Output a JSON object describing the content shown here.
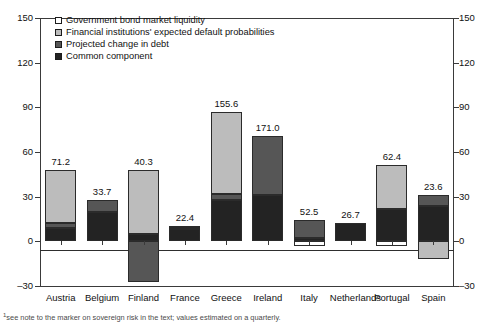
{
  "chart_data": {
    "type": "bar",
    "title": "",
    "subtitle": "",
    "xlabel": "",
    "ylabel": "",
    "stacked": true,
    "grid": false,
    "legend_position": "top-left",
    "ylim": [
      -30,
      150
    ],
    "yticks": [
      -30,
      0,
      30,
      60,
      90,
      120,
      150
    ],
    "ytick_labels_left": [
      "–30",
      "0",
      "30",
      "60",
      "90",
      "120",
      "150"
    ],
    "ytick_labels_right": [
      "–30",
      "0",
      "30",
      "60",
      "90",
      "120",
      "150"
    ],
    "dual_axis": true,
    "categories": [
      "Austria",
      "Belgium",
      "Finland",
      "France",
      "Greece",
      "Ireland",
      "Italy",
      "Netherlands",
      "Portugal",
      "Spain"
    ],
    "data_labels": [
      "71.2",
      "33.7",
      "40.3",
      "22.4",
      "155.6",
      "171.0",
      "52.5",
      "26.7",
      "62.4",
      "23.6"
    ],
    "series": [
      {
        "name": "Common component",
        "color": "#232323",
        "values": [
          9.0,
          19.5,
          5.0,
          8.5,
          28.0,
          31.0,
          2.0,
          12.0,
          22.0,
          24.0
        ]
      },
      {
        "name": "Projected change in debt",
        "color": "#565656",
        "values": [
          3.0,
          8.0,
          -27.0,
          1.0,
          4.0,
          40.0,
          12.0,
          0.0,
          0.0,
          7.0
        ]
      },
      {
        "name": "Financial institutions' expected default probabilities",
        "color": "#bcbcbc",
        "values": [
          36.0,
          0.0,
          43.0,
          1.0,
          55.0,
          0.0,
          0.0,
          0.0,
          29.0,
          -12.0
        ]
      },
      {
        "name": "Government bond market liquidity",
        "color": "#ffffff",
        "values": [
          0.0,
          0.0,
          0.0,
          0.0,
          0.0,
          0.0,
          -3.0,
          0.0,
          -3.0,
          0.0
        ]
      }
    ]
  },
  "legend": {
    "items": [
      {
        "label": "Government bond market liquidity",
        "color": "#ffffff"
      },
      {
        "label": "Financial institutions' expected default probabilities",
        "color": "#bcbcbc"
      },
      {
        "label": "Projected change in debt",
        "color": "#565656"
      },
      {
        "label": "Common component",
        "color": "#232323"
      }
    ]
  },
  "footnote": {
    "marker": "1",
    "text": "see note to the marker on sovereign risk in the text; values estimated on a quarterly."
  }
}
